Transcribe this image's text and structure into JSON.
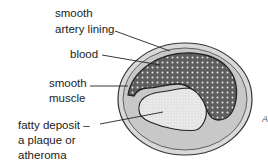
{
  "diagram": {
    "labels": {
      "lining_line1": "smooth",
      "lining_line2": "artery lining",
      "blood": "blood",
      "muscle_line1": "smooth",
      "muscle_line2": "muscle",
      "fatty_line1": "fatty deposit –",
      "fatty_line2": "a plaque or",
      "fatty_line3": "atheroma"
    },
    "edge_mark": "A",
    "colors": {
      "outer_wall": "#d6d6d6",
      "muscle_ring": "#c4c4c4",
      "blood": "#5e5e5e",
      "plaque": "#e6e6e6",
      "outline": "#333333"
    }
  }
}
